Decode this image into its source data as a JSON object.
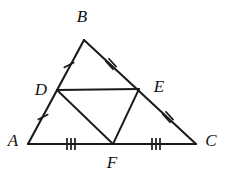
{
  "figure": {
    "kind": "geometry-diagram",
    "shape": "triangle-with-midsegment-triangle",
    "background_color": "#ffffff",
    "stroke_color": "#1a1a1a",
    "label_color": "#111111"
  },
  "vertices": [
    {
      "id": "A",
      "label": "A",
      "x": 28,
      "y": 144,
      "label_x": 13,
      "label_y": 142
    },
    {
      "id": "B",
      "label": "B",
      "x": 84,
      "y": 40,
      "label_x": 82,
      "label_y": 18
    },
    {
      "id": "C",
      "label": "C",
      "x": 196,
      "y": 144,
      "label_x": 211,
      "label_y": 142
    },
    {
      "id": "D",
      "label": "D",
      "x": 57,
      "y": 90,
      "label_x": 41,
      "label_y": 91
    },
    {
      "id": "E",
      "label": "E",
      "x": 139,
      "y": 89,
      "label_x": 159,
      "label_y": 88
    },
    {
      "id": "F",
      "label": "F",
      "x": 113,
      "y": 144,
      "label_x": 112,
      "label_y": 164
    }
  ],
  "segments": [
    {
      "id": "AB",
      "from": "A",
      "to": "B",
      "style": "outer"
    },
    {
      "id": "BC",
      "from": "B",
      "to": "C",
      "style": "outer"
    },
    {
      "id": "AC",
      "from": "A",
      "to": "C",
      "style": "outer"
    },
    {
      "id": "DE",
      "from": "D",
      "to": "E",
      "style": "inner"
    },
    {
      "id": "DF",
      "from": "D",
      "to": "F",
      "style": "inner"
    },
    {
      "id": "EF",
      "from": "E",
      "to": "F",
      "style": "inner"
    }
  ],
  "tick_marks": [
    {
      "id": "tick-BD",
      "on_segment": "BD",
      "count": 1,
      "cx": 69,
      "cy": 65,
      "angle_deg": 62
    },
    {
      "id": "tick-AD",
      "on_segment": "AD",
      "count": 1,
      "cx": 43,
      "cy": 117,
      "angle_deg": 62
    },
    {
      "id": "tick-BE",
      "on_segment": "BE",
      "count": 2,
      "cx": 111,
      "cy": 64,
      "angle_deg": -42
    },
    {
      "id": "tick-EC",
      "on_segment": "EC",
      "count": 2,
      "cx": 168,
      "cy": 117,
      "angle_deg": -42
    },
    {
      "id": "tick-AF",
      "on_segment": "AF",
      "count": 3,
      "cx": 71,
      "cy": 144,
      "angle_deg": 0
    },
    {
      "id": "tick-FC",
      "on_segment": "FC",
      "count": 3,
      "cx": 156,
      "cy": 144,
      "angle_deg": 0
    }
  ],
  "tick_geometry": {
    "half_length": 6,
    "spacing": 4
  }
}
